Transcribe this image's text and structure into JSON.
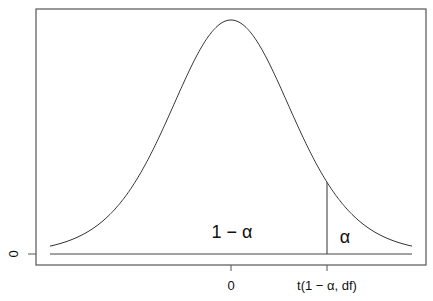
{
  "chart_data": {
    "type": "line",
    "title": "",
    "xlabel": "",
    "ylabel": "",
    "x_ticks": [
      {
        "value": 0,
        "label": "0"
      },
      {
        "value": "t(1-alpha, df)",
        "label": "t(1 − α, df)"
      }
    ],
    "y_ticks": [
      {
        "value": 0,
        "label": "0"
      }
    ],
    "annotations": [
      {
        "text": "1 − α",
        "region": "area left of critical value"
      },
      {
        "text": "α",
        "region": "upper tail area right of critical value"
      }
    ],
    "critical_value_line": {
      "x": "t(1-alpha, df)",
      "from": "baseline",
      "to": "curve"
    },
    "grid": false,
    "legend": null,
    "curve": {
      "shape": "symmetric bell",
      "center": 0
    }
  },
  "labels": {
    "x_tick_0": "0",
    "x_tick_crit": "t(1 − α, df)",
    "y_tick_0": "0",
    "area_left": "1 − α",
    "area_right": "α"
  },
  "colors": {
    "line": "#333333",
    "frame": "#555555",
    "background": "#ffffff"
  }
}
